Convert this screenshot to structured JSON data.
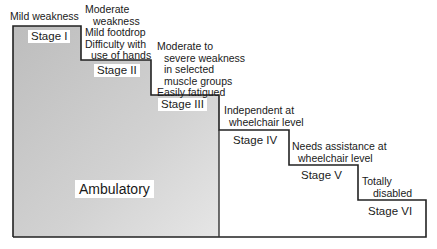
{
  "diagram": {
    "title": "",
    "region_label": "Ambulatory",
    "stages": [
      {
        "label": "Stage I",
        "description": [
          "Mild weakness"
        ]
      },
      {
        "label": "Stage II",
        "description": [
          "Moderate",
          "weakness",
          "Mild footdrop",
          "Difficulty with",
          "use of hands"
        ]
      },
      {
        "label": "Stage III",
        "description": [
          "Moderate to",
          "severe weakness",
          "in selected",
          "muscle groups",
          "Easily fatigued"
        ]
      },
      {
        "label": "Stage IV",
        "description": [
          "Independent at",
          "wheelchair level"
        ]
      },
      {
        "label": "Stage V",
        "description": [
          "Needs assistance at",
          "wheelchair level"
        ]
      },
      {
        "label": "Stage VI",
        "description": [
          "Totally",
          "disabled"
        ]
      }
    ],
    "colors": {
      "ambulatory_fill": "#c9c9c9",
      "outline": "#222222",
      "background": "#ffffff"
    }
  }
}
